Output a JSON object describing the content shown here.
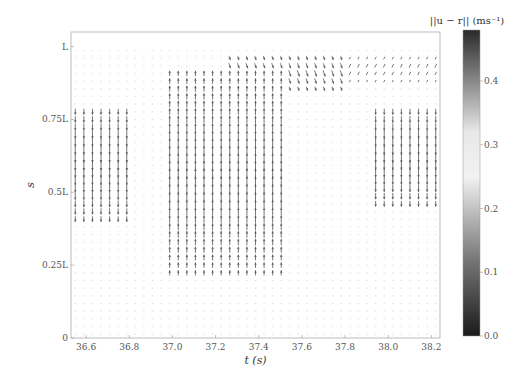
{
  "chart_data": {
    "type": "quiver",
    "title": "",
    "xlabel": "t (s)",
    "ylabel": "s",
    "xlim": [
      36.53,
      38.24
    ],
    "ylim": [
      0,
      1.05
    ],
    "xticks": [
      36.6,
      36.8,
      37.0,
      37.2,
      37.4,
      37.6,
      37.8,
      38.0,
      38.2
    ],
    "xtick_labels": [
      "36.6",
      "36.8",
      "37.0",
      "37.2",
      "37.4",
      "37.6",
      "37.8",
      "38.0",
      "38.2"
    ],
    "yticks": [
      0,
      0.25,
      0.5,
      0.75,
      1.0
    ],
    "ytick_labels": [
      "0",
      "0.25L",
      "0.5L",
      "0.75L",
      "L"
    ],
    "grid": false,
    "colorbar": {
      "label": "||u − r|| (ms⁻¹)",
      "range": [
        0.0,
        0.48
      ],
      "ticks": [
        0.0,
        0.1,
        0.2,
        0.3,
        0.4
      ],
      "tick_labels": [
        "0.0",
        "0.1",
        "0.2",
        "0.3",
        "0.4"
      ],
      "colormap": "dark-light-dark",
      "stops": [
        {
          "value": 0.0,
          "color": "#1a1a1a"
        },
        {
          "value": 0.12,
          "color": "#777777"
        },
        {
          "value": 0.25,
          "color": "#f2f2f2"
        },
        {
          "value": 0.32,
          "color": "#e8e8e8"
        },
        {
          "value": 0.4,
          "color": "#888888"
        },
        {
          "value": 0.48,
          "color": "#2a2a2a"
        }
      ]
    },
    "grid_sampling": {
      "t_count": 43,
      "s_count": 38
    },
    "flow_regions": [
      {
        "name": "left-downward-band",
        "t_range": [
          36.53,
          36.8
        ],
        "s_range": [
          0.4,
          0.8
        ],
        "direction": "down",
        "magnitude": 0.45
      },
      {
        "name": "center-upward-band",
        "t_range": [
          36.98,
          37.52
        ],
        "s_range": [
          0.22,
          0.92
        ],
        "direction": "up",
        "magnitude": 0.42
      },
      {
        "name": "upper-mid-diagonal",
        "t_range": [
          37.25,
          37.8
        ],
        "s_range": [
          0.84,
          0.97
        ],
        "direction": "down-right",
        "magnitude": 0.3
      },
      {
        "name": "upper-right-diagonal",
        "t_range": [
          37.8,
          38.24
        ],
        "s_range": [
          0.88,
          0.97
        ],
        "direction": "up-right",
        "magnitude": 0.2
      },
      {
        "name": "right-downward-band",
        "t_range": [
          37.93,
          38.24
        ],
        "s_range": [
          0.45,
          0.8
        ],
        "direction": "down",
        "magnitude": 0.45
      },
      {
        "name": "background-weak",
        "t_range": [
          36.53,
          38.24
        ],
        "s_range": [
          0.0,
          1.0
        ],
        "direction": "right",
        "magnitude": 0.05
      }
    ]
  }
}
